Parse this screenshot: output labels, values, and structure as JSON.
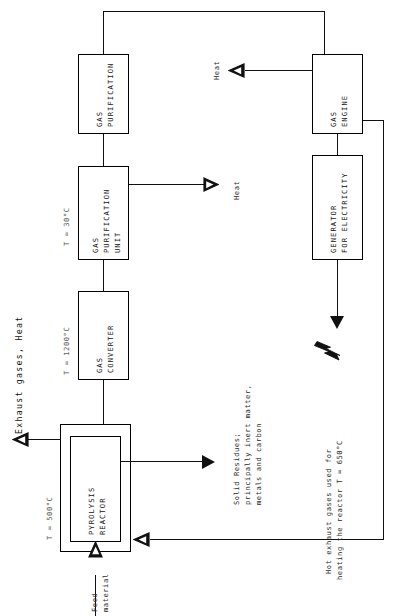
{
  "diagram": {
    "orientation": "rotated-90",
    "stroke_color": "#111111",
    "box_fill": "#ffffff",
    "nodes": [
      {
        "id": "pyrolysis_reactor",
        "label_line1": "PYROLYSIS",
        "label_line2": "REACTOR",
        "temperature": "T = 500°C"
      },
      {
        "id": "gas_converter",
        "label_line1": "GAS",
        "label_line2": "CONVERTER",
        "temperature": "T = 1200°C"
      },
      {
        "id": "gas_purification_unit",
        "label_line1": "GAS",
        "label_line2": "PURIFICATION",
        "label_line3": "UNIT",
        "temperature": "T = 30°C"
      },
      {
        "id": "gas_purification",
        "label_line1": "GAS",
        "label_line2": "PURIFICATION",
        "temperature": ""
      },
      {
        "id": "gas_engine",
        "label_line1": "GAS",
        "label_line2": "ENGINE",
        "temperature": ""
      },
      {
        "id": "generator",
        "label_line1": "GENERATOR",
        "label_line2": "FOR ELECTRICITY",
        "temperature": ""
      }
    ],
    "annotations": {
      "exhaust_gases_heat": "Exhaust gases, Heat",
      "feed_line1": "Feed",
      "feed_line2": "material",
      "solid_residues_line1": "Solid Residues;",
      "solid_residues_line2": "principally inert matter,",
      "solid_residues_line3": "metals and carbon",
      "hot_exhaust_line1": "Hot exhaust gases used for",
      "hot_exhaust_line2": "heating the reactor T = 650°C",
      "heat_engine": "Heat",
      "heat_purification": "Heat"
    },
    "icons": {
      "electricity": "lightning-bolt-icon"
    }
  }
}
